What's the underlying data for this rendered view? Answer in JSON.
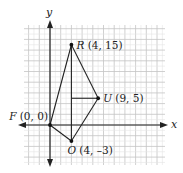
{
  "chart_data": {
    "type": "scatter",
    "title": "",
    "xlabel": "x",
    "ylabel": "y",
    "xlim": [
      -5,
      21
    ],
    "ylim": [
      -7,
      19
    ],
    "grid": true,
    "points": [
      {
        "name": "F",
        "x": 0,
        "y": 0,
        "label": "F (0, 0)",
        "label_side": "left"
      },
      {
        "name": "R",
        "x": 4,
        "y": 15,
        "label": "R (4, 15)",
        "label_side": "right"
      },
      {
        "name": "U",
        "x": 9,
        "y": 5,
        "label": "U (9, 5)",
        "label_side": "right"
      },
      {
        "name": "O",
        "x": 4,
        "y": -3,
        "label": "O (4, –3)",
        "label_side": "below"
      }
    ],
    "segments": [
      {
        "from": "F",
        "to": "R"
      },
      {
        "from": "R",
        "to": "U"
      },
      {
        "from": "U",
        "to": "O"
      },
      {
        "from": "O",
        "to": "F"
      },
      {
        "from": "R",
        "to": "O"
      },
      {
        "from": [
          4,
          5
        ],
        "to": "U"
      }
    ]
  }
}
